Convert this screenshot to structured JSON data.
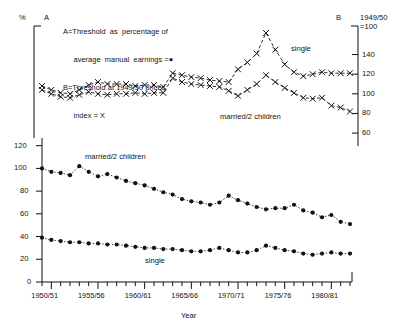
{
  "figure": {
    "left_axis_unit": "%",
    "panel_a_tag": "A",
    "panel_b_tag": "B",
    "xlabel": "Year"
  },
  "legend": {
    "line1": "A=Threshold  as  percentage of",
    "line2": "     average  manual  earnings =●",
    "line3": "B=Threshold at 1949/50 prices",
    "line4": "     index = X",
    "marker_dot": "●",
    "marker_x": "X"
  },
  "right_axis": {
    "header_line1": "1949/50",
    "header_line2": "=100",
    "ticks": [
      "140",
      "120",
      "100",
      "80",
      "60"
    ]
  },
  "left_axis_lower": {
    "ticks": [
      "120",
      "100",
      "80",
      "60",
      "40",
      "20",
      "0"
    ]
  },
  "xaxis": {
    "tick_labels": [
      "1950/51",
      "1955/56",
      "1960/61",
      "1965/66",
      "1970/71",
      "1975/76",
      "1980/81"
    ]
  },
  "annotations": {
    "upper_single": "single",
    "upper_married": "married/2 children",
    "lower_married": "married/2 children",
    "lower_single": "single"
  },
  "colors": {
    "ink": "#111111",
    "background": "#ffffff"
  },
  "chart_data": {
    "type": "line",
    "title": "",
    "xlabel": "Year",
    "panels": [
      {
        "id": "A",
        "name": "Threshold at 1949/50 prices index",
        "marker": "X",
        "linestyle": "dashed",
        "ylabel_left": "%",
        "ylabel_right": "1949/50 = 100",
        "ylim": [
          55,
          165
        ],
        "yticks": [
          60,
          80,
          100,
          120,
          140
        ],
        "grid": false,
        "series": [
          {
            "name": "single",
            "values": [
              108,
              104,
              101,
              100,
              104,
              109,
              112,
              110,
              110,
              110,
              108,
              109,
              109,
              107,
              121,
              119,
              117,
              116,
              114,
              113,
              112,
              125,
              132,
              141,
              162,
              145,
              130,
              122,
              118,
              120,
              122,
              121,
              121,
              121
            ]
          },
          {
            "name": "married/2 children",
            "values": [
              104,
              100,
              97,
              96,
              99,
              102,
              100,
              99,
              100,
              100,
              101,
              100,
              101,
              101,
              116,
              112,
              110,
              109,
              108,
              107,
              103,
              98,
              104,
              110,
              119,
              112,
              106,
              101,
              96,
              95,
              96,
              88,
              86,
              82
            ]
          }
        ]
      },
      {
        "id": "B",
        "name": "Threshold as percentage of average manual earnings",
        "marker": "●",
        "linestyle": "dotted",
        "ylabel_left": "%",
        "ylim": [
          0,
          125
        ],
        "yticks": [
          0,
          20,
          40,
          60,
          80,
          100,
          120
        ],
        "grid": false,
        "series": [
          {
            "name": "married/2 children",
            "values": [
              100,
              97,
              96,
              94,
              102,
              97,
              93,
              95,
              92,
              89,
              87,
              85,
              82,
              79,
              77,
              73,
              71,
              70,
              68,
              70,
              76,
              72,
              69,
              66,
              64,
              65,
              65,
              68,
              63,
              61,
              57,
              59,
              53,
              51
            ]
          },
          {
            "name": "single",
            "values": [
              39,
              37,
              36,
              35,
              35,
              34,
              34,
              33,
              33,
              32,
              31,
              30,
              30,
              29,
              29,
              28,
              27,
              27,
              28,
              30,
              28,
              26,
              26,
              28,
              32,
              30,
              28,
              27,
              25,
              24,
              25,
              26,
              25,
              25
            ]
          }
        ]
      }
    ],
    "x_start_year": "1949/50",
    "x_tick_labels": [
      "1950/51",
      "1955/56",
      "1960/61",
      "1965/66",
      "1970/71",
      "1975/76",
      "1980/81"
    ],
    "x_tick_indices": [
      1,
      6,
      11,
      16,
      21,
      26,
      31
    ],
    "n_points": 34
  }
}
